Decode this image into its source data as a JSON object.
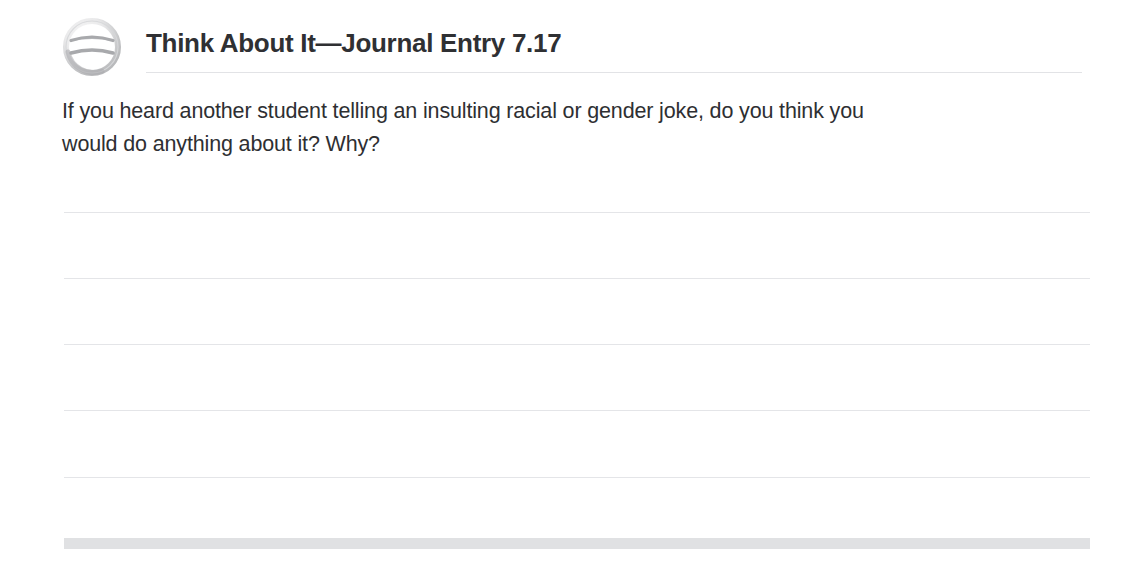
{
  "page": {
    "background_color": "#ffffff",
    "width": 1133,
    "height": 572
  },
  "header": {
    "icon_name": "journal-entry-icon",
    "title": "Think About It—Journal Entry 7.17",
    "title_color": "#2f3033",
    "rule_color": "#e2e3e6"
  },
  "prompt": {
    "line1": "If you heard another student telling an insulting racial or gender joke, do you think you",
    "line2": "would do anything about it? Why?",
    "full_text": "If you heard another student telling an insulting racial or gender joke, do you think you would do anything about it? Why?",
    "text_color": "#2e2f32"
  },
  "writing_area": {
    "line_color": "#e4e5e8",
    "line_count": 5,
    "lines": [
      {
        "label": "writing-line-1",
        "top": 212
      },
      {
        "label": "writing-line-2",
        "top": 278
      },
      {
        "label": "writing-line-3",
        "top": 344
      },
      {
        "label": "writing-line-4",
        "top": 410
      },
      {
        "label": "writing-line-5",
        "top": 477
      }
    ]
  },
  "footer": {
    "band_color": "#e0e1e3",
    "band_label": "footer-band"
  }
}
